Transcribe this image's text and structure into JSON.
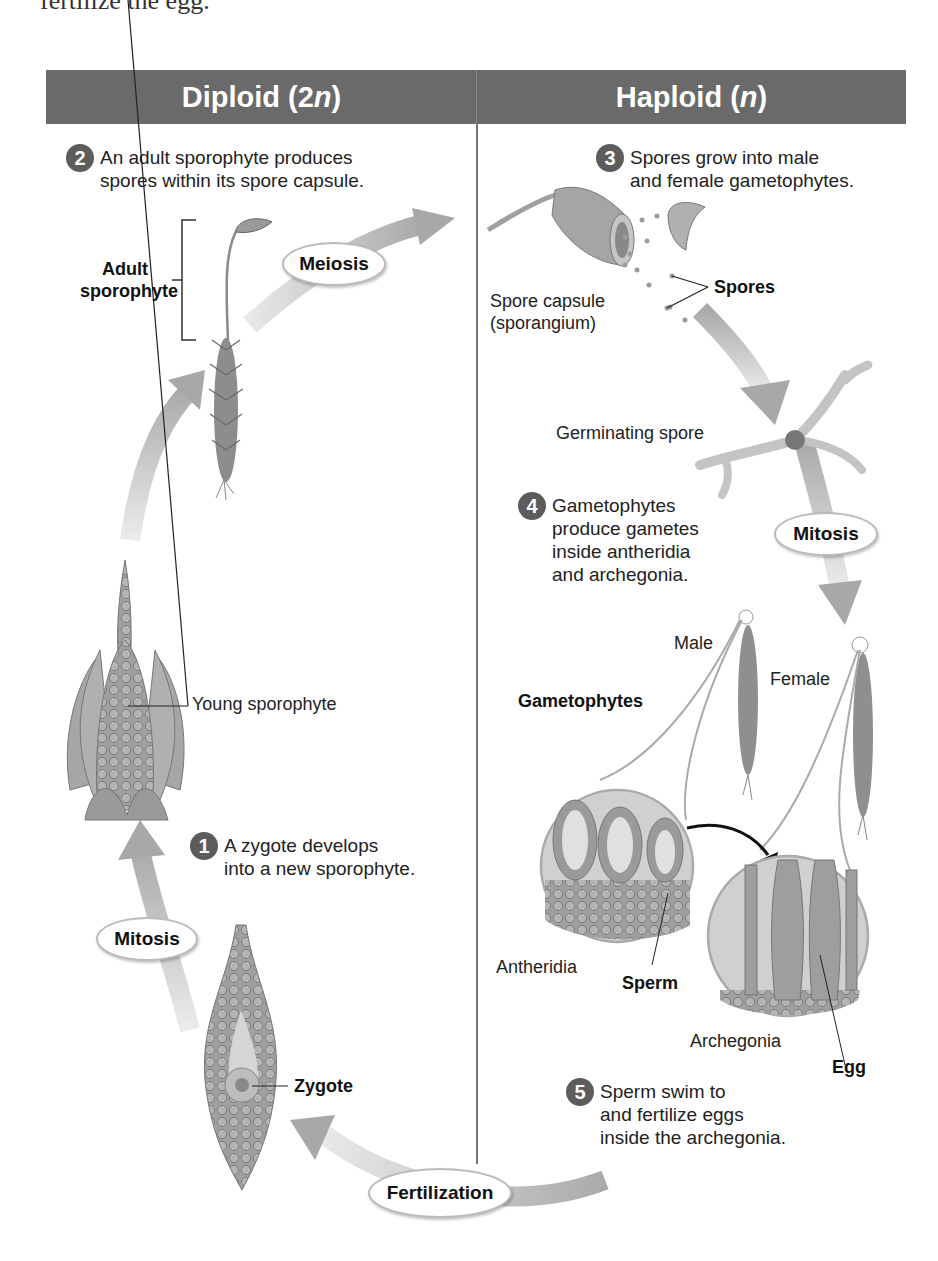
{
  "top_clipped_text": "fertilize the egg.",
  "header": {
    "left_title": "Diploid (2n)",
    "left_title_main": "Diploid (2",
    "left_title_italic": "n",
    "left_title_end": ")",
    "right_title_main": "Haploid (",
    "right_title_italic": "n",
    "right_title_end": ")",
    "background_color": "#6a6a6a"
  },
  "steps": [
    {
      "number": "1",
      "line1": "A zygote develops",
      "line2": "into a new sporophyte."
    },
    {
      "number": "2",
      "line1": "An adult sporophyte produces",
      "line2": "spores within its spore capsule."
    },
    {
      "number": "3",
      "line1": "Spores grow into male",
      "line2": "and female gametophytes."
    },
    {
      "number": "4",
      "line1": "Gametophytes",
      "line2": "produce gametes",
      "line3": "inside antheridia",
      "line4": "and archegonia."
    },
    {
      "number": "5",
      "line1": "Sperm swim to",
      "line2": "and fertilize eggs",
      "line3": "inside the archegonia."
    }
  ],
  "process_labels": {
    "meiosis": "Meiosis",
    "mitosis_right": "Mitosis",
    "mitosis_left": "Mitosis",
    "fertilization": "Fertilization"
  },
  "structure_labels": {
    "adult_sporophyte_line1": "Adult",
    "adult_sporophyte_line2": "sporophyte",
    "spore_capsule_line1": "Spore capsule",
    "spore_capsule_line2": "(sporangium)",
    "spores": "Spores",
    "germinating_spore": "Germinating spore",
    "male": "Male",
    "female": "Female",
    "gametophytes": "Gametophytes",
    "antheridia": "Antheridia",
    "sperm": "Sperm",
    "archegonia": "Archegonia",
    "egg": "Egg",
    "young_sporophyte": "Young sporophyte",
    "zygote": "Zygote"
  },
  "colors": {
    "arrow": "#b8b8b8",
    "plant": "#8e8e8e",
    "step_badge": "#5c5c5c"
  }
}
